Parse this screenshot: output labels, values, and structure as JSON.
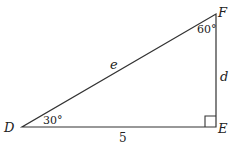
{
  "diagram": {
    "type": "right-triangle",
    "vertices": {
      "D": {
        "label": "D"
      },
      "E": {
        "label": "E"
      },
      "F": {
        "label": "F"
      }
    },
    "angles": {
      "D": "30°",
      "F": "60°",
      "E": "right-angle"
    },
    "sides": {
      "DF": "e",
      "EF": "d",
      "DE": "5"
    }
  }
}
